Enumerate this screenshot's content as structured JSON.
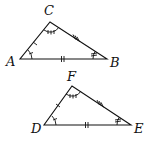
{
  "diagram": {
    "type": "congruent-triangles",
    "triangles": [
      {
        "name": "ABC",
        "vertices": [
          {
            "label": "A",
            "x": 20,
            "y": 59,
            "lx": 6,
            "ly": 66
          },
          {
            "label": "B",
            "x": 107,
            "y": 59,
            "lx": 110,
            "ly": 67
          },
          {
            "label": "C",
            "x": 50,
            "y": 22,
            "lx": 44,
            "ly": 15
          }
        ],
        "side_marks": {
          "AC": 1,
          "AB": 2,
          "CB": 3
        },
        "angle_marks": {
          "A": 1,
          "B": 2,
          "C": 3
        }
      },
      {
        "name": "DEF",
        "vertices": [
          {
            "label": "D",
            "x": 44,
            "y": 125,
            "lx": 31,
            "ly": 133
          },
          {
            "label": "E",
            "x": 131,
            "y": 125,
            "lx": 134,
            "ly": 133
          },
          {
            "label": "F",
            "x": 72,
            "y": 86,
            "lx": 67,
            "ly": 81
          }
        ],
        "side_marks": {
          "DF": 1,
          "DE": 2,
          "FE": 3
        },
        "angle_marks": {
          "D": 1,
          "E": 2,
          "F": 3
        }
      }
    ]
  }
}
